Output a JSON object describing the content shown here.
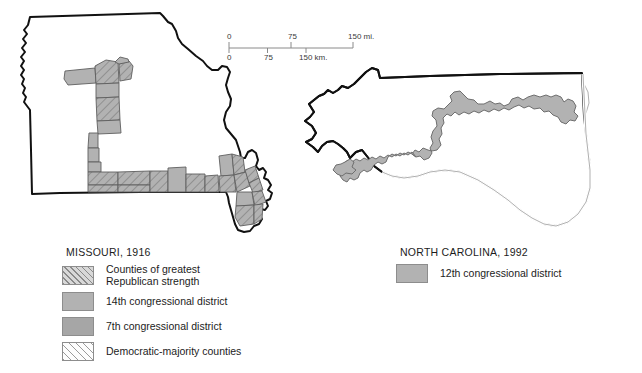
{
  "figure": {
    "kind": "two-panel map figure",
    "background_color": "#ffffff"
  },
  "scalebar": {
    "name": "distance-scale-bar",
    "miles": {
      "ticks": [
        "0",
        "75",
        "150"
      ],
      "unit": "mi."
    },
    "kilometers": {
      "ticks": [
        "0",
        "75",
        "150"
      ],
      "unit": "km."
    },
    "miles_labels": [
      "0",
      "75",
      "150 mi."
    ],
    "km_labels": [
      "0",
      "75",
      "150 km."
    ],
    "line_color": "#8a8a8a"
  },
  "maps": {
    "missouri": {
      "state_name": "Missouri",
      "year": "1916",
      "outline_color": "#111111",
      "fill_color": "#ffffff"
    },
    "north_carolina": {
      "state_name": "North Carolina",
      "year": "1992",
      "outline_color": "#111111",
      "coast_color": "#9a9a9a",
      "fill_color": "#ffffff",
      "district_fill": "#b2b2b2",
      "district_outline": "#6e6e6e"
    }
  },
  "legends": {
    "missouri": {
      "title": "MISSOURI, 1916",
      "items": [
        {
          "label": "Counties of greatest\nRepublican strength",
          "swatch": "hatch-dense-gray",
          "color": "#d8d8d8"
        },
        {
          "label": "14th congressional district",
          "swatch": "solid-mid-gray",
          "color": "#b2b2b2"
        },
        {
          "label": "7th congressional district",
          "swatch": "solid-dark-gray",
          "color": "#a6a6a6"
        },
        {
          "label": "Democratic-majority counties",
          "swatch": "hatch-light-white",
          "color": "#fdfdfd"
        }
      ]
    },
    "north_carolina": {
      "title": "NORTH CAROLINA, 1992",
      "items": [
        {
          "label": "12th congressional district",
          "swatch": "solid-mid-gray",
          "color": "#b2b2b2"
        }
      ]
    }
  }
}
